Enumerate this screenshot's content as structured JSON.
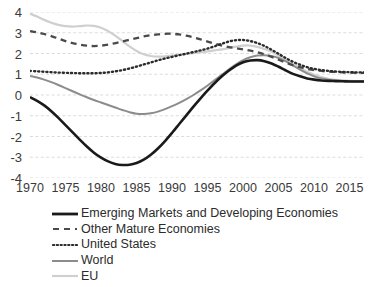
{
  "chart_data": {
    "type": "line",
    "title": "",
    "subtitle": "",
    "xlabel": "",
    "ylabel": "",
    "xlim": [
      1970,
      2017
    ],
    "ylim": [
      -4,
      4
    ],
    "grid": true,
    "legend_position": "bottom-left",
    "xticks": [
      "1970",
      "1975",
      "1980",
      "1985",
      "1990",
      "1995",
      "2000",
      "2005",
      "2010",
      "2015"
    ],
    "yticks": [
      "4",
      "3",
      "2",
      "1",
      "0",
      "-1",
      "-2",
      "-3",
      "-4"
    ],
    "x": [
      1970,
      1971,
      1972,
      1973,
      1974,
      1975,
      1976,
      1977,
      1978,
      1979,
      1980,
      1981,
      1982,
      1983,
      1984,
      1985,
      1986,
      1987,
      1988,
      1989,
      1990,
      1991,
      1992,
      1993,
      1994,
      1995,
      1996,
      1997,
      1998,
      1999,
      2000,
      2001,
      2002,
      2003,
      2004,
      2005,
      2006,
      2007,
      2008,
      2009,
      2010,
      2011,
      2012,
      2013,
      2014,
      2015,
      2016,
      2017
    ],
    "series": [
      {
        "name": "Emerging Markets and Developing Economies",
        "style": "solid",
        "color": "#1a1a1a",
        "width": 2.6,
        "values": [
          -0.1,
          -0.28,
          -0.5,
          -0.78,
          -1.1,
          -1.45,
          -1.8,
          -2.15,
          -2.48,
          -2.78,
          -3.02,
          -3.2,
          -3.32,
          -3.37,
          -3.36,
          -3.28,
          -3.12,
          -2.88,
          -2.58,
          -2.22,
          -1.82,
          -1.4,
          -0.98,
          -0.56,
          -0.16,
          0.22,
          0.58,
          0.9,
          1.18,
          1.42,
          1.58,
          1.66,
          1.68,
          1.63,
          1.52,
          1.36,
          1.18,
          1.02,
          0.9,
          0.8,
          0.74,
          0.7,
          0.68,
          0.67,
          0.66,
          0.65,
          0.65,
          0.65
        ]
      },
      {
        "name": "Other Mature Economies",
        "style": "dashed",
        "color": "#4a4a4a",
        "width": 2.3,
        "values": [
          3.08,
          3.02,
          2.94,
          2.84,
          2.72,
          2.6,
          2.5,
          2.43,
          2.38,
          2.36,
          2.38,
          2.43,
          2.5,
          2.58,
          2.66,
          2.74,
          2.82,
          2.88,
          2.92,
          2.95,
          2.95,
          2.92,
          2.86,
          2.78,
          2.68,
          2.57,
          2.47,
          2.38,
          2.31,
          2.25,
          2.2,
          2.14,
          2.06,
          1.96,
          1.84,
          1.7,
          1.56,
          1.44,
          1.34,
          1.26,
          1.2,
          1.16,
          1.13,
          1.11,
          1.09,
          1.08,
          1.07,
          1.07
        ]
      },
      {
        "name": "United States",
        "style": "dotted",
        "color": "#2b2b2b",
        "width": 2.4,
        "values": [
          1.16,
          1.14,
          1.12,
          1.1,
          1.08,
          1.07,
          1.06,
          1.05,
          1.05,
          1.05,
          1.06,
          1.09,
          1.14,
          1.2,
          1.28,
          1.37,
          1.47,
          1.57,
          1.67,
          1.76,
          1.84,
          1.92,
          1.99,
          2.07,
          2.15,
          2.24,
          2.35,
          2.47,
          2.58,
          2.64,
          2.65,
          2.6,
          2.5,
          2.36,
          2.18,
          1.98,
          1.78,
          1.6,
          1.46,
          1.34,
          1.26,
          1.2,
          1.16,
          1.13,
          1.11,
          1.1,
          1.09,
          1.09
        ]
      },
      {
        "name": "World",
        "style": "solid",
        "color": "#8c8c8c",
        "width": 2.0,
        "values": [
          0.92,
          0.84,
          0.74,
          0.62,
          0.48,
          0.33,
          0.18,
          0.03,
          -0.11,
          -0.24,
          -0.36,
          -0.48,
          -0.6,
          -0.72,
          -0.83,
          -0.9,
          -0.92,
          -0.88,
          -0.8,
          -0.68,
          -0.54,
          -0.38,
          -0.2,
          0.0,
          0.22,
          0.46,
          0.72,
          0.98,
          1.24,
          1.48,
          1.68,
          1.82,
          1.9,
          1.92,
          1.88,
          1.78,
          1.62,
          1.42,
          1.22,
          1.04,
          0.9,
          0.8,
          0.74,
          0.7,
          0.68,
          0.67,
          0.66,
          0.66
        ]
      },
      {
        "name": "EU",
        "style": "solid",
        "color": "#cfcfcf",
        "width": 2.2,
        "values": [
          3.92,
          3.78,
          3.62,
          3.48,
          3.38,
          3.32,
          3.3,
          3.32,
          3.35,
          3.33,
          3.24,
          3.08,
          2.86,
          2.6,
          2.34,
          2.12,
          1.96,
          1.88,
          1.85,
          1.86,
          1.9,
          1.94,
          1.98,
          2.02,
          2.06,
          2.1,
          2.15,
          2.2,
          2.26,
          2.33,
          2.38,
          2.38,
          2.32,
          2.22,
          2.08,
          1.9,
          1.7,
          1.5,
          1.3,
          1.12,
          0.98,
          0.86,
          0.78,
          0.73,
          0.7,
          0.68,
          0.67,
          0.66
        ]
      }
    ]
  },
  "legend": {
    "items": [
      {
        "label": "Emerging Markets and Developing Economies",
        "swatch": "solid-black-line-swatch"
      },
      {
        "label": "Other Mature Economies",
        "swatch": "dashed-gray-line-swatch"
      },
      {
        "label": "United States",
        "swatch": "dotted-line-swatch"
      },
      {
        "label": "World",
        "swatch": "solid-gray-line-swatch"
      },
      {
        "label": "EU",
        "swatch": "solid-lightgray-line-swatch"
      }
    ]
  },
  "colors": {
    "grid": "#d8d8d8",
    "axis_text": "#3a3a3a",
    "background": "#ffffff"
  }
}
